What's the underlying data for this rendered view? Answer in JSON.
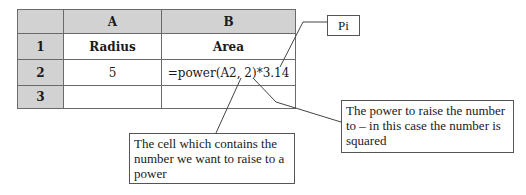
{
  "spreadsheet": {
    "column_headers": [
      "",
      "A",
      "B"
    ],
    "rows": [
      {
        "row_label": "1",
        "cells": [
          "Radius",
          "Area"
        ]
      },
      {
        "row_label": "2",
        "cells": [
          "5",
          "=power(A2, 2)*3.14"
        ]
      },
      {
        "row_label": "3",
        "cells": [
          "",
          ""
        ]
      }
    ]
  },
  "callouts": {
    "pi": "Pi",
    "cell_reference": "The cell which contains the number we want to raise to a power",
    "power": "The power to raise the number to – in this case the number is squared"
  },
  "colors": {
    "header_fill": "#d2d2d2",
    "grid_line": "#6a6a6a",
    "leader_line": "#444444"
  }
}
